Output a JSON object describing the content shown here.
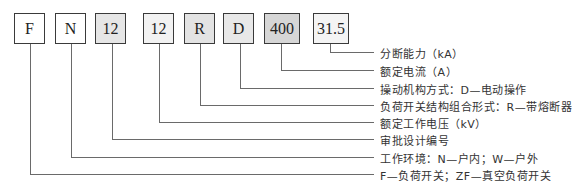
{
  "diagram": {
    "boxes": [
      {
        "text": "F",
        "shade": "#ffffff"
      },
      {
        "text": "N",
        "shade": "#ffffff"
      },
      {
        "text": "12",
        "shade": "#e6e6e6"
      },
      {
        "text": "12",
        "shade": "#f2f2f2"
      },
      {
        "text": "R",
        "shade": "#e3e3e3"
      },
      {
        "text": "D",
        "shade": "#e8e8e8"
      },
      {
        "text": "400",
        "shade": "#d6d6d6"
      },
      {
        "text": "31.5",
        "shade": "#f4f4f4"
      }
    ],
    "labels": [
      "分断能力（kA）",
      "额定电流（A）",
      "操动机构方式：D—电动操作",
      "负荷开关结构组合形式：R—带熔断器",
      "额定工作电压（kV）",
      "审批设计编号",
      "工作环境：N—户内；W—户外",
      "F—负荷开关；ZF—真空负荷开关"
    ],
    "colors": {
      "line": "#6a6a6a",
      "border": "#3a3a3a",
      "text": "#333333"
    }
  }
}
